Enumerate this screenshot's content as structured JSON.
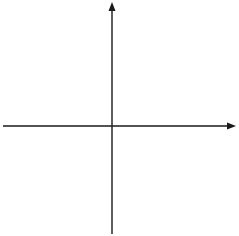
{
  "diagram": {
    "type": "coordinate-plane",
    "x_axis": {
      "label": "x",
      "min": -6,
      "max": 6,
      "tick_labels": [
        "-5",
        "-4",
        "-3",
        "-2",
        "-1",
        "1",
        "2",
        "3",
        "4",
        "5"
      ]
    },
    "y_axis": {
      "label": "y",
      "min": -6,
      "max": 6,
      "tick_labels": [
        "5",
        "4",
        "3",
        "2",
        "1",
        "-1",
        "-2",
        "-3",
        "-4",
        "-5"
      ]
    },
    "grid": {
      "style": "dotted",
      "spacing": 1
    },
    "colors": {
      "axis": "#1a1a1a",
      "grid": "#555555",
      "background": "#ffffff"
    }
  }
}
